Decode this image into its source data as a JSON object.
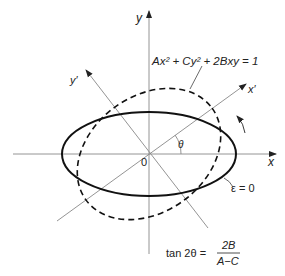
{
  "diagram": {
    "axes": {
      "x_label": "x",
      "y_label": "y",
      "x_prime_label": "x′",
      "y_prime_label": "y′",
      "origin_label": "0",
      "angle_label": "θ"
    },
    "curves": {
      "dashed_equation": "Ax² + Cy² + 2Bxy = 1",
      "solid_label": "ε = 0"
    },
    "formula": {
      "lhs": "tan 2θ =",
      "numerator": "2B",
      "denominator": "A−C"
    },
    "colors": {
      "axis": "#888888",
      "curve": "#111111",
      "text": "#222222"
    }
  }
}
